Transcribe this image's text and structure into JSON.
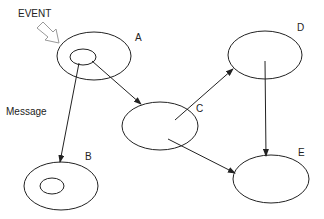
{
  "diagram": {
    "event_label": "EVENT",
    "message_label": "Message",
    "stroke_color": "#222222",
    "background": "#ffffff",
    "nodes": [
      {
        "id": "A",
        "label": "A",
        "cx": 94,
        "cy": 56,
        "rx": 37,
        "ry": 24,
        "inner": {
          "cx": 83,
          "cy": 57,
          "rx": 13,
          "ry": 8
        },
        "label_x": 136,
        "label_y": 41
      },
      {
        "id": "B",
        "label": "B",
        "cx": 61,
        "cy": 186,
        "rx": 37,
        "ry": 24,
        "inner": {
          "cx": 52,
          "cy": 186,
          "rx": 12,
          "ry": 8
        },
        "label_x": 85,
        "label_y": 160
      },
      {
        "id": "C",
        "label": "C",
        "cx": 160,
        "cy": 126,
        "rx": 38,
        "ry": 24,
        "label_x": 196,
        "label_y": 112
      },
      {
        "id": "D",
        "label": "D",
        "cx": 265,
        "cy": 55,
        "rx": 37,
        "ry": 24,
        "label_x": 297,
        "label_y": 31
      },
      {
        "id": "E",
        "label": "E",
        "cx": 271,
        "cy": 179,
        "rx": 38,
        "ry": 24,
        "label_x": 298,
        "label_y": 156
      }
    ],
    "edges": [
      {
        "from": "A",
        "to": "B",
        "x1": 79,
        "y1": 63,
        "x2": 60,
        "y2": 162
      },
      {
        "from": "A",
        "to": "C",
        "x1": 92,
        "y1": 61,
        "x2": 141,
        "y2": 104
      },
      {
        "from": "C",
        "to": "D",
        "x1": 175,
        "y1": 120,
        "x2": 233,
        "y2": 69
      },
      {
        "from": "C",
        "to": "E",
        "x1": 168,
        "y1": 139,
        "x2": 235,
        "y2": 173
      },
      {
        "from": "D",
        "to": "E",
        "x1": 265,
        "y1": 61,
        "x2": 266,
        "y2": 156
      }
    ]
  }
}
